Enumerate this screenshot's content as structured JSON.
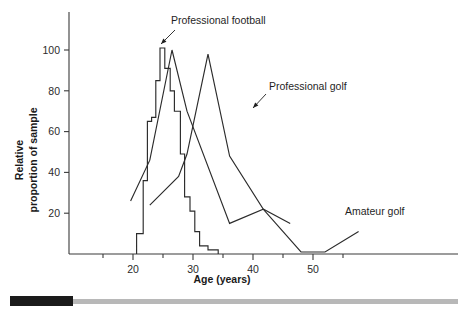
{
  "chart_data": {
    "type": "line",
    "title": "",
    "xlabel": "Age (years)",
    "ylabel": "Relative proportion of sample",
    "ylabel_line1": "Relative",
    "ylabel_line2": "proportion of sample",
    "xlim": [
      14,
      58
    ],
    "ylim": [
      0,
      115
    ],
    "grid": false,
    "legend_position": "inline-annotations",
    "xticks": [
      20,
      30,
      40,
      50
    ],
    "xtick_labels": [
      "20",
      "30",
      "40",
      "50"
    ],
    "xminor_ticks": [
      15,
      25,
      35,
      45,
      55
    ],
    "yticks": [
      20,
      40,
      60,
      80,
      100
    ],
    "ytick_labels": [
      "20",
      "40",
      "60",
      "80",
      "100"
    ],
    "series": [
      {
        "name": "Professional football",
        "style": "histogram-step",
        "annotation": "Professional football",
        "points": [
          [
            20.6,
            0
          ],
          [
            20.6,
            10
          ],
          [
            21.7,
            10
          ],
          [
            21.7,
            36
          ],
          [
            22.4,
            36
          ],
          [
            22.4,
            65
          ],
          [
            23.1,
            65
          ],
          [
            23.1,
            67
          ],
          [
            23.8,
            67
          ],
          [
            23.8,
            85
          ],
          [
            24.5,
            85
          ],
          [
            24.5,
            101
          ],
          [
            25.3,
            101
          ],
          [
            25.3,
            91
          ],
          [
            26.2,
            91
          ],
          [
            26.2,
            80
          ],
          [
            26.9,
            80
          ],
          [
            26.9,
            70
          ],
          [
            27.9,
            70
          ],
          [
            27.9,
            49
          ],
          [
            28.6,
            49
          ],
          [
            28.6,
            28
          ],
          [
            29.5,
            28
          ],
          [
            29.5,
            21
          ],
          [
            30.3,
            21
          ],
          [
            30.3,
            11
          ],
          [
            31.1,
            11
          ],
          [
            31.1,
            4
          ],
          [
            32.5,
            4
          ],
          [
            32.5,
            2
          ],
          [
            34.2,
            2
          ],
          [
            34.2,
            0
          ]
        ]
      },
      {
        "name": "Professional golf",
        "style": "polyline",
        "annotation": "Professional golf",
        "points": [
          [
            19.6,
            26
          ],
          [
            22.8,
            46
          ],
          [
            26.5,
            100
          ],
          [
            29.0,
            70
          ],
          [
            36.1,
            15
          ],
          [
            41.7,
            22
          ],
          [
            48.0,
            1
          ],
          [
            52.0,
            1
          ],
          [
            57.6,
            11
          ]
        ]
      },
      {
        "name": "Amateur golf",
        "style": "polyline",
        "annotation": "Amateur golf",
        "points": [
          [
            22.8,
            24
          ],
          [
            27.6,
            38
          ],
          [
            29.0,
            49
          ],
          [
            32.5,
            98
          ],
          [
            36.1,
            48
          ],
          [
            41.7,
            22
          ],
          [
            46.2,
            15
          ]
        ]
      }
    ],
    "annotations": [
      {
        "text": "Professional football",
        "label_x": 171,
        "label_y": 24,
        "arrow_from_x": 175,
        "arrow_from_y": 30,
        "arrow_to_x": 161,
        "arrow_to_y": 44
      },
      {
        "text": "Professional golf",
        "label_x": 269,
        "label_y": 90,
        "arrow_from_x": 266,
        "arrow_from_y": 94,
        "arrow_to_x": 253,
        "arrow_to_y": 108
      },
      {
        "text": "Amateur golf",
        "label_x": 345,
        "label_y": 215,
        "arrow_from_x": null,
        "arrow_from_y": null,
        "arrow_to_x": null,
        "arrow_to_y": null
      }
    ]
  },
  "colors": {
    "line": "#2b2b2b",
    "axis": "#3a3a3a",
    "text": "#1a1a1a",
    "scrollbar_thumb": "#1b1b1b",
    "scrollbar_track": "#b8b8b8",
    "background": "#ffffff"
  },
  "scrollbar": {
    "name": "horizontal-scrollbar"
  }
}
